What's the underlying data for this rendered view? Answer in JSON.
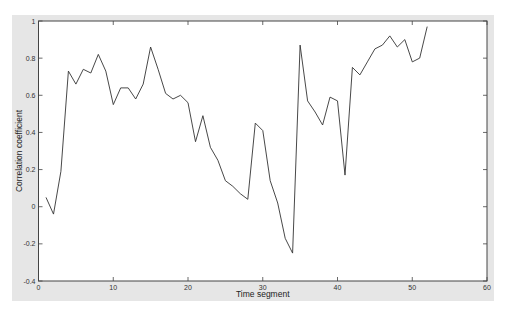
{
  "chart_data": {
    "type": "line",
    "title": "",
    "xlabel": "Time segment",
    "ylabel": "Correlation coefficient",
    "xlim": [
      0,
      60
    ],
    "ylim": [
      -0.4,
      1
    ],
    "xticks": [
      0,
      10,
      20,
      30,
      40,
      50,
      60
    ],
    "yticks": [
      -0.4,
      -0.2,
      0,
      0.2,
      0.4,
      0.6,
      0.8,
      1
    ],
    "xtick_labels": [
      "0",
      "10",
      "20",
      "30",
      "40",
      "50",
      "60"
    ],
    "ytick_labels": [
      "-0.4",
      "-0.2",
      "0",
      "0.2",
      "0.4",
      "0.6",
      "0.8",
      "1"
    ],
    "grid": false,
    "legend": null,
    "series": [
      {
        "name": "Correlation coefficient",
        "color": "#333333",
        "x": [
          1,
          2,
          3,
          4,
          5,
          6,
          7,
          8,
          9,
          10,
          11,
          12,
          13,
          14,
          15,
          16,
          17,
          18,
          19,
          20,
          21,
          22,
          23,
          24,
          25,
          26,
          27,
          28,
          29,
          30,
          31,
          32,
          33,
          34,
          35,
          36,
          37,
          38,
          39,
          40,
          41,
          42,
          43,
          44,
          45,
          46,
          47,
          48,
          49,
          50,
          51,
          52
        ],
        "y": [
          0.05,
          -0.04,
          0.19,
          0.73,
          0.66,
          0.74,
          0.72,
          0.82,
          0.73,
          0.55,
          0.64,
          0.64,
          0.58,
          0.66,
          0.86,
          0.74,
          0.61,
          0.58,
          0.6,
          0.56,
          0.35,
          0.49,
          0.32,
          0.25,
          0.14,
          0.11,
          0.07,
          0.04,
          0.45,
          0.41,
          0.14,
          0.02,
          -0.17,
          -0.25,
          0.87,
          0.57,
          0.51,
          0.44,
          0.59,
          0.57,
          0.17,
          0.75,
          0.71,
          0.78,
          0.85,
          0.87,
          0.92,
          0.86,
          0.9,
          0.78,
          0.8,
          0.97
        ]
      }
    ]
  },
  "colors": {
    "figure_background": "#e6e6e6",
    "axes_background": "#ffffff",
    "axis_color": "#444444"
  }
}
